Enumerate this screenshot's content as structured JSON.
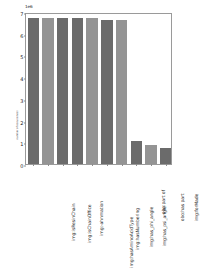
{
  "chart_data": {
    "type": "bar",
    "title": "",
    "xlabel": "",
    "ylabel": "number of occurrences",
    "offset_text": "1e6",
    "ylim": [
      0,
      7
    ],
    "yticks": [
      0,
      1,
      2,
      3,
      4,
      5,
      6,
      7
    ],
    "ytick_labels": [
      "0",
      "1",
      "2",
      "3",
      "4",
      "5",
      "6",
      "7"
    ],
    "grid": false,
    "legend": "none",
    "categories": [
      "img:isResinChain",
      "img:isChainOffice",
      "img:-ahnmation",
      "img:hasAminoAcidType",
      "img:hasNumbering",
      "img:has_phi_angle",
      "img:has_psi_angle",
      "obo:part of",
      "obo:has part",
      "img:forMade"
    ],
    "values": [
      6.72,
      6.72,
      6.72,
      6.72,
      6.72,
      6.62,
      6.62,
      1.05,
      0.88,
      0.72
    ],
    "bar_colors": [
      "#6b6b6b",
      "#949494",
      "#6b6b6b",
      "#6b6b6b",
      "#949494",
      "#6b6b6b",
      "#949494",
      "#6b6b6b",
      "#949494",
      "#6b6b6b"
    ]
  },
  "figure": {
    "background": "#ffffff",
    "axes_edge_color": "#9a9a9a"
  }
}
